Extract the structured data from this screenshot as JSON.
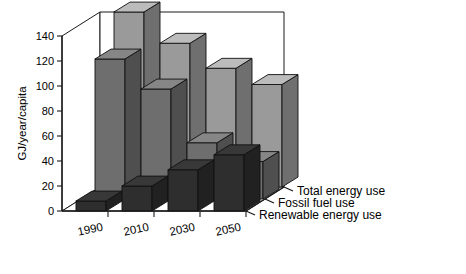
{
  "chart_data": {
    "type": "bar",
    "title": "",
    "subtitle": "",
    "xlabel": "",
    "ylabel": "GJ/year/capita",
    "ylim": [
      0,
      140
    ],
    "yticks": [
      0,
      20,
      40,
      60,
      80,
      100,
      120,
      140
    ],
    "grid": false,
    "projection": "3d",
    "legend_position": "depth-axis-right",
    "categories": [
      "1990",
      "2010",
      "2030",
      "2050"
    ],
    "series": [
      {
        "name": "Total energy use",
        "values": [
          140,
          115,
          95,
          82
        ],
        "color": "#9a9a9a"
      },
      {
        "name": "Fossil fuel use",
        "values": [
          112,
          88,
          45,
          30
        ],
        "color": "#6e6e6e"
      },
      {
        "name": "Renewable energy use",
        "values": [
          8,
          20,
          33,
          45
        ],
        "color": "#2e2e2e"
      }
    ]
  },
  "axes": {
    "y_label": "GJ/year/capita",
    "y_tick_labels": [
      "140",
      "120",
      "100",
      "80",
      "60",
      "40",
      "20",
      "0"
    ],
    "x_tick_labels": [
      "1990",
      "2010",
      "2030",
      "2050"
    ],
    "depth_tick_labels": [
      "Total energy use",
      "Fossil fuel use",
      "Renewable energy use"
    ]
  },
  "colors": {
    "total": "#9a9a9a",
    "fossil": "#6e6e6e",
    "renewable": "#2e2e2e",
    "top_light": "#b4b4b4",
    "side_dark": "#5a5a5a",
    "axis": "#1a1a1a",
    "floor": "#ffffff",
    "background": "#ffffff"
  }
}
